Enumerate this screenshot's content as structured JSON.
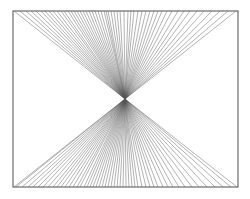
{
  "diagram": {
    "frame": {
      "x": 13,
      "y": 11,
      "width": 225,
      "height": 176,
      "stroke": "#6b6b6b"
    },
    "center": {
      "x": 125,
      "y": 99
    },
    "line_color": "#555555",
    "top_fan_x": [
      14,
      20,
      26,
      31,
      36,
      41,
      45,
      49,
      53,
      57,
      61,
      64,
      68,
      71,
      74,
      77,
      80,
      83,
      86,
      89,
      92,
      95,
      98,
      101,
      104,
      106,
      108,
      111,
      114,
      117,
      120,
      124,
      128,
      131,
      134,
      138,
      142,
      146,
      150,
      154,
      158,
      162,
      167,
      172,
      178,
      184,
      190,
      197,
      204,
      212,
      220,
      228,
      236
    ],
    "bottom_fan_x": [
      14,
      16,
      22,
      28,
      33,
      38,
      43,
      48,
      53,
      57,
      61,
      65,
      69,
      73,
      77,
      80,
      84,
      87,
      90,
      93,
      96,
      99,
      102,
      105,
      108,
      111,
      114,
      117,
      120,
      123,
      126,
      129,
      132,
      135,
      138,
      142,
      146,
      150,
      154,
      158,
      163,
      168,
      173,
      179,
      185,
      192,
      199,
      207,
      215,
      223,
      231,
      237
    ]
  }
}
